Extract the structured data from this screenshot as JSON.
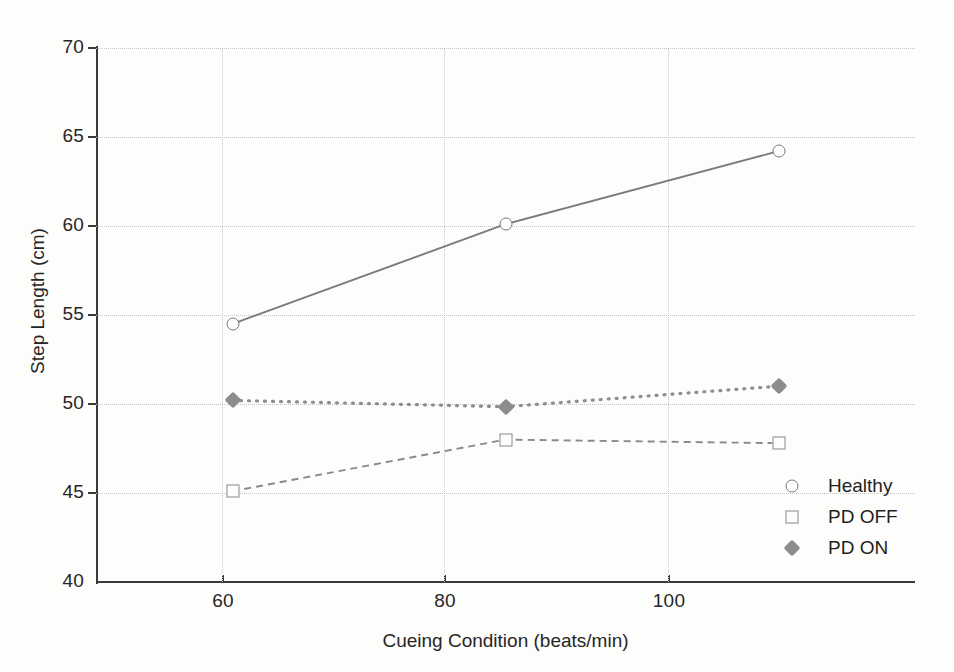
{
  "chart_data": {
    "type": "line",
    "title": "",
    "xlabel": "Cueing Condition (beats/min)",
    "ylabel": "Step Length (cm)",
    "categories": [
      "60",
      "80",
      "100"
    ],
    "x": [
      60,
      80,
      100
    ],
    "xlim": [
      50,
      110
    ],
    "ylim": [
      40,
      70
    ],
    "yticks": [
      "70",
      "65",
      "60",
      "55",
      "50",
      "45",
      "40"
    ],
    "ytick_values": [
      70,
      65,
      60,
      55,
      50,
      45,
      40
    ],
    "xticks": [
      "60",
      "80",
      "100"
    ],
    "grid": "both-dotted",
    "legend_position": "bottom-right",
    "series": [
      {
        "name": "Healthy",
        "values": [
          54.5,
          60.1,
          64.2
        ],
        "marker": "open-circle",
        "line_style": "solid",
        "color": "#7b7b7b"
      },
      {
        "name": "PD OFF",
        "values": [
          45.1,
          48.0,
          47.8
        ],
        "marker": "open-square",
        "line_style": "dashed",
        "color": "#8a8a8a"
      },
      {
        "name": "PD ON",
        "values": [
          50.2,
          49.85,
          51.0
        ],
        "marker": "filled-diamond",
        "line_style": "dotted",
        "color": "#8d8d8d"
      }
    ]
  },
  "legend": {
    "items": [
      {
        "label": "Healthy"
      },
      {
        "label": "PD OFF"
      },
      {
        "label": "PD ON"
      }
    ]
  },
  "colors": {
    "background": "#fdfdfc",
    "axis": "#3a3a3a",
    "grid": "#c4c4c4",
    "text": "#262626"
  }
}
